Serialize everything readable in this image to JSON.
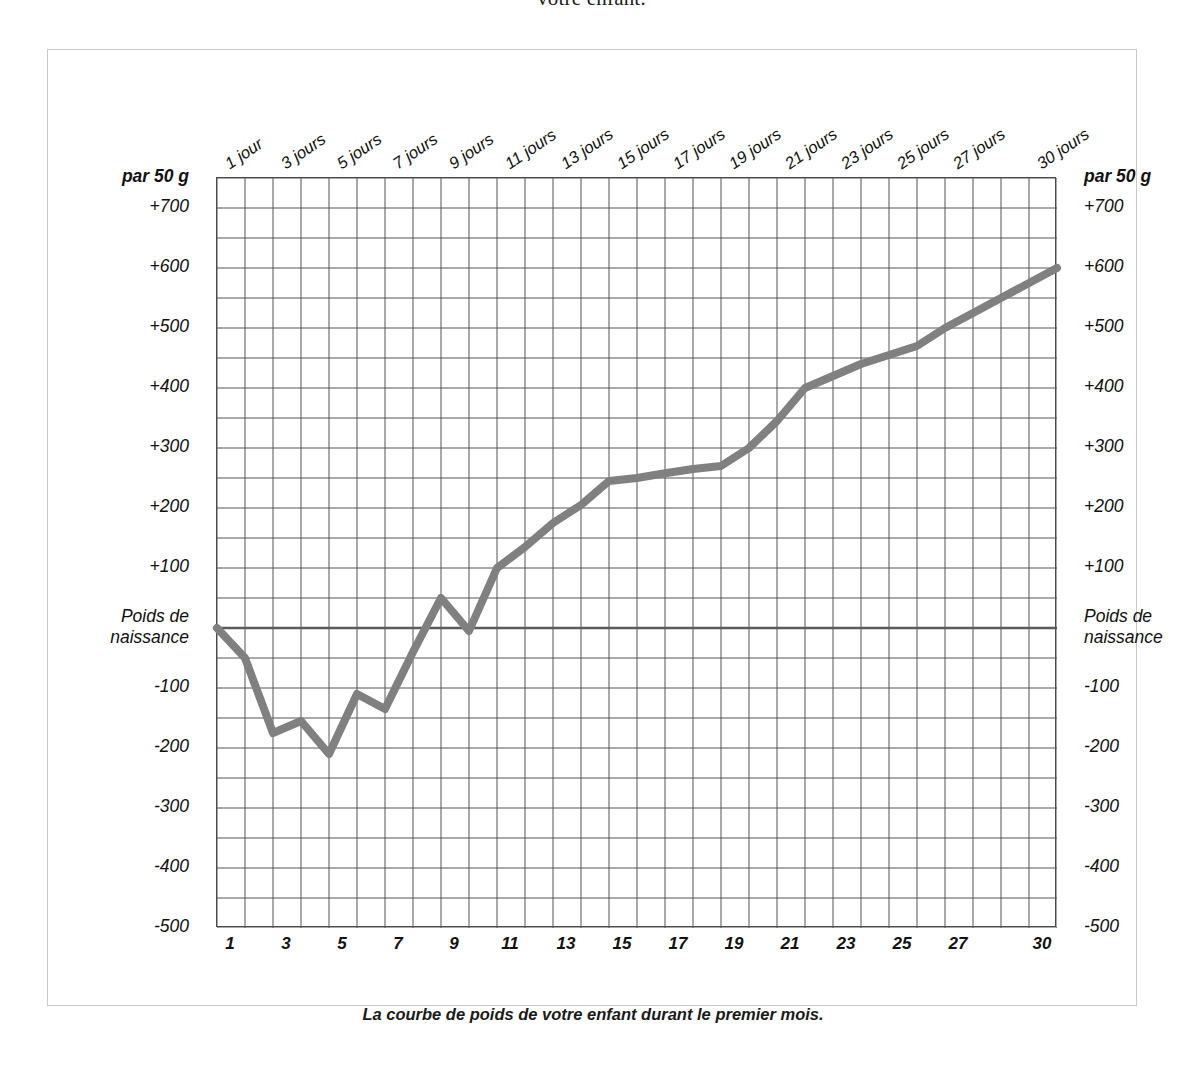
{
  "page": {
    "top_cut_text": "votre enfant."
  },
  "figure": {
    "caption": "La courbe de poids de votre enfant durant le premier mois.",
    "axis_unit_label": "par 50 g",
    "baseline_label": "Poids de\nnaissance",
    "border_color": "#c9c9c9",
    "grid_color": "#555555",
    "curve_color": "#808080",
    "baseline_color": "#5a5a5a"
  },
  "chart_data": {
    "type": "line",
    "title": "La courbe de poids de votre enfant durant le premier mois.",
    "xlabel": "",
    "ylabel": "par 50 g",
    "xlim": [
      0,
      30
    ],
    "ylim": [
      -500,
      750
    ],
    "grid": true,
    "grid_step_x": 1,
    "grid_step_y": 50,
    "legend": "none",
    "unit": "g",
    "baseline_value": 0,
    "baseline_label": "Poids de naissance",
    "y_ticks": [
      {
        "value": 750,
        "label": "par 50 g",
        "bold": true
      },
      {
        "value": 700,
        "label": "+700",
        "bold": false
      },
      {
        "value": 600,
        "label": "+600",
        "bold": false
      },
      {
        "value": 500,
        "label": "+500",
        "bold": false
      },
      {
        "value": 400,
        "label": "+400",
        "bold": false
      },
      {
        "value": 300,
        "label": "+300",
        "bold": false
      },
      {
        "value": 200,
        "label": "+200",
        "bold": false
      },
      {
        "value": 100,
        "label": "+100",
        "bold": false
      },
      {
        "value": 0,
        "label": "Poids de\nnaissance",
        "bold": false
      },
      {
        "value": -100,
        "label": "-100",
        "bold": false
      },
      {
        "value": -200,
        "label": "-200",
        "bold": false
      },
      {
        "value": -300,
        "label": "-300",
        "bold": false
      },
      {
        "value": -400,
        "label": "-400",
        "bold": false
      },
      {
        "value": -500,
        "label": "-500",
        "bold": false
      }
    ],
    "x_top_ticks": [
      {
        "day": 1,
        "label": "1 jour"
      },
      {
        "day": 3,
        "label": "3 jours"
      },
      {
        "day": 5,
        "label": "5 jours"
      },
      {
        "day": 7,
        "label": "7 jours"
      },
      {
        "day": 9,
        "label": "9 jours"
      },
      {
        "day": 11,
        "label": "11 jours"
      },
      {
        "day": 13,
        "label": "13 jours"
      },
      {
        "day": 15,
        "label": "15 jours"
      },
      {
        "day": 17,
        "label": "17 jours"
      },
      {
        "day": 19,
        "label": "19 jours"
      },
      {
        "day": 21,
        "label": "21 jours"
      },
      {
        "day": 23,
        "label": "23 jours"
      },
      {
        "day": 25,
        "label": "25 jours"
      },
      {
        "day": 27,
        "label": "27 jours"
      },
      {
        "day": 30,
        "label": "30 jours"
      }
    ],
    "x_bottom_ticks": [
      {
        "day": 1,
        "label": "1"
      },
      {
        "day": 3,
        "label": "3"
      },
      {
        "day": 5,
        "label": "5"
      },
      {
        "day": 7,
        "label": "7"
      },
      {
        "day": 9,
        "label": "9"
      },
      {
        "day": 11,
        "label": "11"
      },
      {
        "day": 13,
        "label": "13"
      },
      {
        "day": 15,
        "label": "15"
      },
      {
        "day": 17,
        "label": "17"
      },
      {
        "day": 19,
        "label": "19"
      },
      {
        "day": 21,
        "label": "21"
      },
      {
        "day": 23,
        "label": "23"
      },
      {
        "day": 25,
        "label": "25"
      },
      {
        "day": 27,
        "label": "27"
      },
      {
        "day": 30,
        "label": "30"
      }
    ],
    "x": [
      0,
      1,
      2,
      3,
      4,
      5,
      6,
      7,
      8,
      9,
      10,
      11,
      12,
      13,
      14,
      15,
      16,
      17,
      18,
      19,
      20,
      21,
      22,
      23,
      24,
      25,
      26,
      27,
      28,
      29,
      30
    ],
    "series": [
      {
        "name": "Poids de l'enfant",
        "values": [
          0,
          -50,
          -175,
          -155,
          -210,
          -110,
          -135,
          -40,
          50,
          -5,
          100,
          135,
          175,
          205,
          245,
          250,
          258,
          265,
          270,
          300,
          345,
          400,
          420,
          440,
          455,
          470,
          500,
          525,
          550,
          575,
          600
        ]
      }
    ]
  }
}
